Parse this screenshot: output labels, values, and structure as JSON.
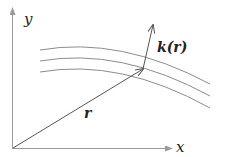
{
  "diagram": {
    "axes": {
      "x_label": "x",
      "y_label": "y"
    },
    "vectors": [
      {
        "id": "r",
        "label": "r",
        "from": "origin",
        "to": "point on curve"
      },
      {
        "id": "k",
        "label": "k(r)",
        "from": "point on curve",
        "to": "direction of k"
      }
    ],
    "curves": {
      "count": 3,
      "description": "family of parallel curved lines (wavefronts)"
    },
    "colors": {
      "axis": "#9a9a9a",
      "curve": "#8c8c8c",
      "vector": "#555555",
      "text": "#222222"
    }
  }
}
